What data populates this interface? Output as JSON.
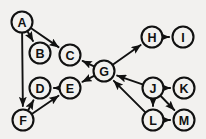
{
  "diagram": {
    "type": "directed-graph",
    "background_color": "#f2f1ef",
    "node_fill_color": "#f2f1ef",
    "stroke_color": "#111111",
    "node_radius": 10.5,
    "width": 206,
    "height": 139,
    "nodes": [
      {
        "id": "A",
        "label": "A",
        "x": 22,
        "y": 22
      },
      {
        "id": "B",
        "label": "B",
        "x": 40,
        "y": 53
      },
      {
        "id": "C",
        "label": "C",
        "x": 70,
        "y": 55
      },
      {
        "id": "D",
        "label": "D",
        "x": 40,
        "y": 88
      },
      {
        "id": "E",
        "label": "E",
        "x": 70,
        "y": 88
      },
      {
        "id": "F",
        "label": "F",
        "x": 23,
        "y": 120
      },
      {
        "id": "G",
        "label": "G",
        "x": 104,
        "y": 71
      },
      {
        "id": "H",
        "label": "H",
        "x": 152,
        "y": 37
      },
      {
        "id": "I",
        "label": "I",
        "x": 183,
        "y": 37
      },
      {
        "id": "J",
        "label": "J",
        "x": 153,
        "y": 88
      },
      {
        "id": "K",
        "label": "K",
        "x": 184,
        "y": 88
      },
      {
        "id": "L",
        "label": "L",
        "x": 153,
        "y": 120
      },
      {
        "id": "M",
        "label": "M",
        "x": 184,
        "y": 120
      }
    ],
    "edges": [
      {
        "from": "A",
        "to": "B",
        "directed": true
      },
      {
        "from": "A",
        "to": "C",
        "directed": true
      },
      {
        "from": "A",
        "to": "F",
        "directed": true
      },
      {
        "from": "F",
        "to": "D",
        "directed": true
      },
      {
        "from": "F",
        "to": "E",
        "directed": true
      },
      {
        "from": "E",
        "to": "D",
        "directed": true
      },
      {
        "from": "G",
        "to": "C",
        "directed": true
      },
      {
        "from": "G",
        "to": "E",
        "directed": true
      },
      {
        "from": "G",
        "to": "H",
        "directed": true
      },
      {
        "from": "H",
        "to": "I",
        "directed": true
      },
      {
        "from": "J",
        "to": "G",
        "directed": true
      },
      {
        "from": "J",
        "to": "K",
        "directed": true
      },
      {
        "from": "J",
        "to": "L",
        "directed": true
      },
      {
        "from": "J",
        "to": "M",
        "directed": true
      },
      {
        "from": "L",
        "to": "G",
        "directed": true
      },
      {
        "from": "L",
        "to": "M",
        "directed": true
      }
    ]
  }
}
